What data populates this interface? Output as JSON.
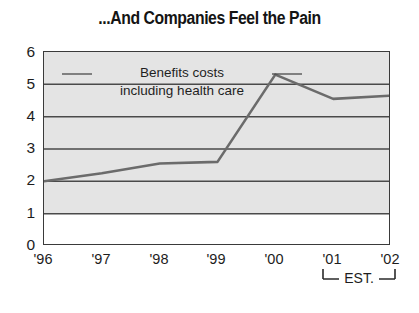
{
  "chart_data": {
    "type": "line",
    "title": "...And Companies Feel the Pain",
    "subtitle": "",
    "xlabel": "",
    "ylabel": "",
    "categories": [
      "'96",
      "'97",
      "'98",
      "'99",
      "'00",
      "'01",
      "'02"
    ],
    "series": [
      {
        "name": "Benefits costs including health care",
        "values": [
          2.0,
          2.25,
          2.55,
          2.6,
          5.3,
          4.55,
          4.65
        ]
      }
    ],
    "annotations": [
      {
        "text_line1": "Benefits costs",
        "text_line2": "including health care"
      },
      {
        "text": "EST.",
        "applies_to": [
          "'01",
          "'02"
        ]
      }
    ],
    "ylim": [
      0,
      6
    ],
    "yticks": [
      "6",
      "5",
      "4",
      "3",
      "2",
      "1",
      "0"
    ],
    "ytick_values": [
      6,
      5,
      4,
      3,
      2,
      1,
      0
    ],
    "grid": true,
    "grid_axis": "y",
    "legend": "none",
    "legend_position": "inline-annotation",
    "colors": {
      "line": "#6b6b6b",
      "grid": "#4a4a4a",
      "frame": "#3a3a3a",
      "plot_background_upper": "#e3e3e3",
      "plot_background_lower": "#ffffff",
      "text": "#1a1a1a"
    }
  },
  "axis": {
    "y_tick_labels": [
      "6",
      "5",
      "4",
      "3",
      "2",
      "1",
      "0"
    ],
    "x_tick_labels": [
      "'96",
      "'97",
      "'98",
      "'99",
      "'00",
      "'01",
      "'02"
    ]
  },
  "annotation": {
    "line1": "Benefits costs",
    "line2": "including health care",
    "est": "EST."
  },
  "title": "...And Companies Feel the Pain"
}
